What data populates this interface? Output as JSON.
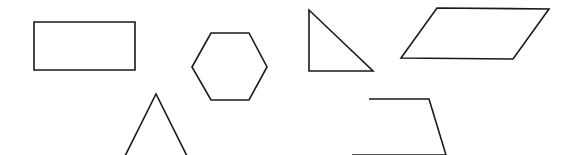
{
  "canvas": {
    "width": 566,
    "height": 155,
    "background": "#ffffff",
    "stroke": "#1a1a1a"
  },
  "shapes": [
    {
      "name": "rectangle",
      "points": "34,22 135,22 135,70 34,70"
    },
    {
      "name": "hexagon",
      "points": "192,67 211,33 249,33 267,67 249,100 211,100"
    },
    {
      "name": "isosceles-triangle",
      "points": "125,156 156,94 187,156"
    },
    {
      "name": "right-triangle",
      "points": "309,10 309,71 373,71"
    },
    {
      "name": "parallelogram",
      "points": "437,8 549,9 513,59 401,58"
    },
    {
      "name": "trapezoid",
      "points": "369,99 429,99 446,155 352,155"
    }
  ]
}
